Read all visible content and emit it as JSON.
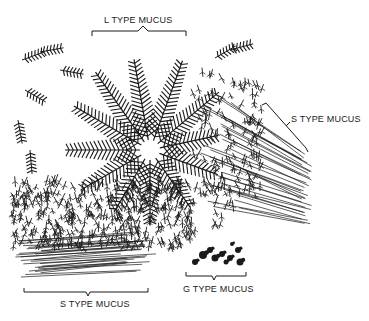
{
  "figure": {
    "labels": {
      "l_type": "L TYPE MUCUS",
      "s_type_right": "S TYPE MUCUS",
      "s_type_bottom": "S TYPE MUCUS",
      "g_type": "G TYPE MUCUS"
    },
    "colors": {
      "ink": "#1a1a1a",
      "background": "#ffffff"
    },
    "fern_center": [
      150,
      150
    ],
    "fern_fronds": [
      {
        "angle": -100,
        "length": 92
      },
      {
        "angle": -70,
        "length": 95
      },
      {
        "angle": -40,
        "length": 90
      },
      {
        "angle": -12,
        "length": 70
      },
      {
        "angle": 20,
        "length": 72
      },
      {
        "angle": 55,
        "length": 70
      },
      {
        "angle": 90,
        "length": 75
      },
      {
        "angle": 120,
        "length": 72
      },
      {
        "angle": 150,
        "length": 80
      },
      {
        "angle": 180,
        "length": 85
      },
      {
        "angle": -150,
        "length": 88
      },
      {
        "angle": -125,
        "length": 95
      }
    ]
  }
}
